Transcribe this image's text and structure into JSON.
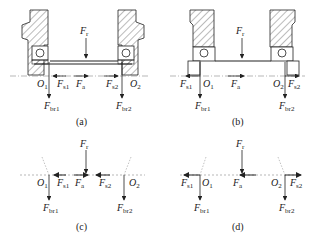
{
  "panels": [
    {
      "id": "a",
      "caption": "(a)",
      "labels": {
        "fr": {
          "main": "F",
          "sub": "r"
        },
        "o1": {
          "main": "O",
          "sub": "1"
        },
        "o2": {
          "main": "O",
          "sub": "2"
        },
        "fs1": {
          "main": "F",
          "sub": "s1"
        },
        "fa": {
          "main": "F",
          "sub": "a"
        },
        "fs2": {
          "main": "F",
          "sub": "s2"
        },
        "fbr1": {
          "main": "F",
          "sub": "br1"
        },
        "fbr2": {
          "main": "F",
          "sub": "br2"
        }
      }
    },
    {
      "id": "b",
      "caption": "(b)",
      "labels": {
        "fr": {
          "main": "F",
          "sub": "r"
        },
        "o1": {
          "main": "O",
          "sub": "1"
        },
        "o2": {
          "main": "O",
          "sub": "2"
        },
        "fs1": {
          "main": "F",
          "sub": "s1"
        },
        "fa": {
          "main": "F",
          "sub": "a"
        },
        "fs2": {
          "main": "F",
          "sub": "s2"
        },
        "fbr1": {
          "main": "F",
          "sub": "br1"
        },
        "fbr2": {
          "main": "F",
          "sub": "br2"
        }
      }
    },
    {
      "id": "c",
      "caption": "(c)",
      "labels": {
        "fr": {
          "main": "F",
          "sub": "r"
        },
        "o1": {
          "main": "O",
          "sub": "1"
        },
        "o2": {
          "main": "O",
          "sub": "2"
        },
        "fs1": {
          "main": "F",
          "sub": "s1"
        },
        "fa": {
          "main": "F",
          "sub": "a"
        },
        "fs2": {
          "main": "F",
          "sub": "s2"
        },
        "fbr1": {
          "main": "F",
          "sub": "br1"
        },
        "fbr2": {
          "main": "F",
          "sub": "br2"
        }
      }
    },
    {
      "id": "d",
      "caption": "(d)",
      "labels": {
        "fr": {
          "main": "F",
          "sub": "r"
        },
        "o1": {
          "main": "O",
          "sub": "1"
        },
        "o2": {
          "main": "O",
          "sub": "2"
        },
        "fs1": {
          "main": "F",
          "sub": "s1"
        },
        "fa": {
          "main": "F",
          "sub": "a"
        },
        "fs2": {
          "main": "F",
          "sub": "s2"
        },
        "fbr1": {
          "main": "F",
          "sub": "br1"
        },
        "fbr2": {
          "main": "F",
          "sub": "br2"
        }
      }
    }
  ],
  "colors": {
    "line": "#222222",
    "hatch": "#555555",
    "dashed": "#888888"
  }
}
